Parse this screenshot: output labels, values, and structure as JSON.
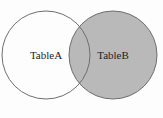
{
  "diagram": {
    "type": "venn",
    "sets": [
      {
        "label": "TableA",
        "filled": false
      },
      {
        "label": "TableB",
        "filled": true
      }
    ],
    "colors": {
      "fill": "#b9b9b9",
      "stroke": "#6e6e6e",
      "background": "#fdfdfd"
    }
  }
}
